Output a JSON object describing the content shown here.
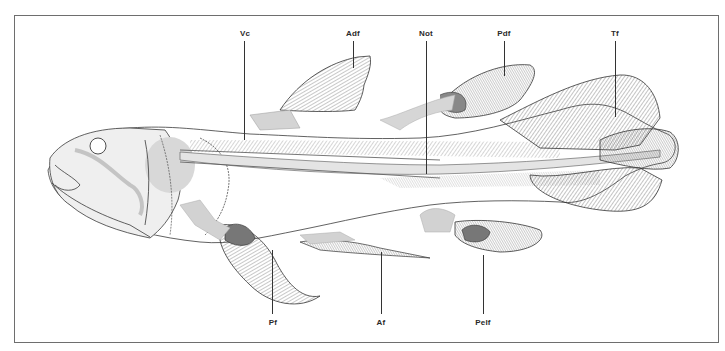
{
  "figure": {
    "labels_top": [
      {
        "id": "Vc",
        "text": "Vc",
        "x": 245,
        "y": 33,
        "line_from": 42,
        "line_to": 140
      },
      {
        "id": "Adf",
        "text": "Adf",
        "x": 353,
        "y": 33,
        "line_from": 42,
        "line_to": 68
      },
      {
        "id": "Not",
        "text": "Not",
        "x": 426,
        "y": 33,
        "line_from": 42,
        "line_to": 174
      },
      {
        "id": "Pdf",
        "text": "Pdf",
        "x": 504,
        "y": 33,
        "line_from": 42,
        "line_to": 76
      },
      {
        "id": "Tf",
        "text": "Tf",
        "x": 615,
        "y": 33,
        "line_from": 42,
        "line_to": 117
      }
    ],
    "labels_bottom": [
      {
        "id": "Pf",
        "text": "Pf",
        "x": 273,
        "y": 320,
        "line_from": 250,
        "line_to": 314
      },
      {
        "id": "Af",
        "text": "Af",
        "x": 381,
        "y": 320,
        "line_from": 252,
        "line_to": 314
      },
      {
        "id": "Pelf",
        "text": "Pelf",
        "x": 483,
        "y": 320,
        "line_from": 255,
        "line_to": 314
      }
    ]
  },
  "colors": {
    "outline": "#3a3a3a",
    "bone": "#cfcfcf",
    "ray": "#444444",
    "frame": "#6e6e6e"
  }
}
